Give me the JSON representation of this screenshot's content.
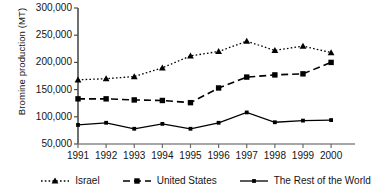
{
  "chart_data": {
    "type": "line",
    "title": "",
    "xlabel": "",
    "ylabel": "Bromine production (MT)",
    "categories": [
      "1991",
      "1992",
      "1993",
      "1994",
      "1995",
      "1996",
      "1997",
      "1998",
      "1999",
      "2000"
    ],
    "ylim": [
      50000,
      300000
    ],
    "ytick_labels": [
      "50,000",
      "100,000",
      "150,000",
      "200,000",
      "250,000",
      "300,000"
    ],
    "ytick_values": [
      50000,
      100000,
      150000,
      200000,
      250000,
      300000
    ],
    "grid": false,
    "legend_position": "bottom",
    "series": [
      {
        "name": "Israel",
        "marker": "triangle",
        "line_style": "dotted",
        "color": "#000000",
        "values": [
          168000,
          170000,
          174000,
          190000,
          212000,
          220000,
          239000,
          222000,
          230000,
          218000
        ]
      },
      {
        "name": "United States",
        "marker": "square",
        "line_style": "dashed",
        "color": "#000000",
        "values": [
          133000,
          133000,
          131000,
          130000,
          126000,
          153000,
          173000,
          177000,
          179000,
          200000
        ]
      },
      {
        "name": "The Rest of the World",
        "marker": "small-square",
        "line_style": "solid",
        "color": "#000000",
        "values": [
          85000,
          89000,
          78000,
          87000,
          78000,
          89000,
          108000,
          90000,
          93000,
          94000
        ]
      }
    ]
  },
  "axes": {
    "y_axis_title": "Bromine production (MT)"
  },
  "legend": {
    "items": [
      {
        "label": "Israel",
        "key": "dotted-triangle-key"
      },
      {
        "label": "United States",
        "key": "dashed-square-key"
      },
      {
        "label": "The Rest of the World",
        "key": "solid-square-key"
      }
    ]
  }
}
